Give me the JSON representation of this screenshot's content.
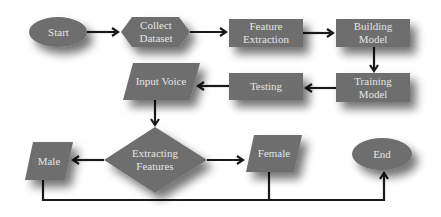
{
  "diagram": {
    "type": "flowchart",
    "colors": {
      "node_fill": "#6e6e6e",
      "node_text": "#e4e4e4",
      "edge": "#1a1a1a",
      "shadow": "#9a9a9a",
      "background": "#ffffff"
    },
    "nodes": {
      "start": {
        "label": "Start",
        "shape": "ellipse"
      },
      "collect_dataset": {
        "label": "Collect\nDataset",
        "shape": "hexagon"
      },
      "feature_extraction": {
        "label": "Feature\nExtraction",
        "shape": "rectangle"
      },
      "building_model": {
        "label": "Building\nModel",
        "shape": "rectangle"
      },
      "training_model": {
        "label": "Training\nModel",
        "shape": "rectangle"
      },
      "testing": {
        "label": "Testing",
        "shape": "rectangle"
      },
      "input_voice": {
        "label": "Input Voice",
        "shape": "parallelogram"
      },
      "extracting_features": {
        "label": "Extracting\nFeatures",
        "shape": "diamond"
      },
      "male": {
        "label": "Male",
        "shape": "parallelogram"
      },
      "female": {
        "label": "Female",
        "shape": "parallelogram"
      },
      "end": {
        "label": "End",
        "shape": "ellipse"
      }
    },
    "edges": [
      {
        "from": "Start",
        "to": "Collect Dataset"
      },
      {
        "from": "Collect Dataset",
        "to": "Feature Extraction"
      },
      {
        "from": "Feature Extraction",
        "to": "Building Model"
      },
      {
        "from": "Building Model",
        "to": "Training Model"
      },
      {
        "from": "Training Model",
        "to": "Testing"
      },
      {
        "from": "Testing",
        "to": "Input Voice"
      },
      {
        "from": "Input Voice",
        "to": "Extracting Features"
      },
      {
        "from": "Extracting Features",
        "to": "Male"
      },
      {
        "from": "Extracting Features",
        "to": "Female"
      },
      {
        "from": "Male",
        "to": "End"
      },
      {
        "from": "Female",
        "to": "End"
      }
    ]
  }
}
